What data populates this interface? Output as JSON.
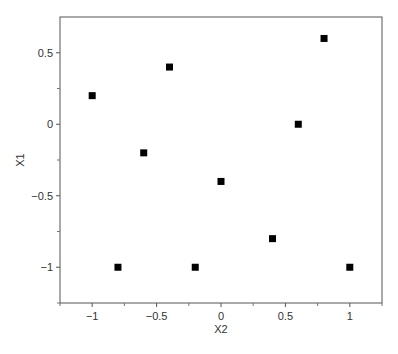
{
  "chart_data": {
    "type": "scatter",
    "title": "",
    "xlabel": "X2",
    "ylabel": "X1",
    "xlim": [
      -1.25,
      1.25
    ],
    "ylim": [
      -1.25,
      0.75
    ],
    "xticks": [
      -1,
      -0.5,
      0,
      0.5,
      1
    ],
    "xtick_labels": [
      "−1",
      "−0.5",
      "0",
      "0.5",
      "1"
    ],
    "xminor_ticks": [
      -1.25,
      -0.75,
      -0.25,
      0.25,
      0.75,
      1.25
    ],
    "yticks": [
      0.5,
      0,
      -0.5,
      -1
    ],
    "ytick_labels": [
      "0.5",
      "0",
      "−0.5",
      "−1"
    ],
    "yminor_ticks": [
      0.25,
      -0.25,
      -0.75,
      -1.25
    ],
    "grid": false,
    "legend": null,
    "marker": "square",
    "marker_color": "#000000",
    "series": [
      {
        "name": "design points",
        "points": [
          {
            "x": -1.0,
            "y": 0.2
          },
          {
            "x": -0.8,
            "y": -1.0
          },
          {
            "x": -0.6,
            "y": -0.2
          },
          {
            "x": -0.4,
            "y": 0.4
          },
          {
            "x": -0.2,
            "y": -1.0
          },
          {
            "x": 0.0,
            "y": -0.4
          },
          {
            "x": 0.4,
            "y": -0.8
          },
          {
            "x": 0.6,
            "y": 0.0
          },
          {
            "x": 0.8,
            "y": 0.6
          },
          {
            "x": 1.0,
            "y": -1.0
          }
        ]
      }
    ]
  },
  "caption_partial": "FIGURE 10.20 ..."
}
